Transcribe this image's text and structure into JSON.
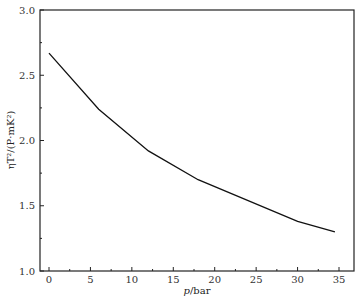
{
  "chart_data": {
    "type": "line",
    "title": "",
    "xlabel": "p/bar",
    "ylabel": "ηT²/(P·mK²)",
    "xlim": [
      -1,
      36
    ],
    "ylim": [
      1.0,
      3.0
    ],
    "xticks": [
      0,
      5,
      10,
      15,
      20,
      25,
      30,
      35
    ],
    "yticks": [
      1.0,
      1.5,
      2.0,
      2.5,
      3.0
    ],
    "grid": false,
    "legend": null,
    "series": [
      {
        "name": "ηT²",
        "x": [
          0,
          6,
          12,
          18,
          30,
          34.5
        ],
        "y": [
          2.67,
          2.24,
          1.92,
          1.7,
          1.38,
          1.3
        ]
      }
    ]
  },
  "labels": {
    "xlabel_italic": "p",
    "xlabel_unit": "/bar",
    "ylabel": "ηT²/(P·mK²)"
  }
}
